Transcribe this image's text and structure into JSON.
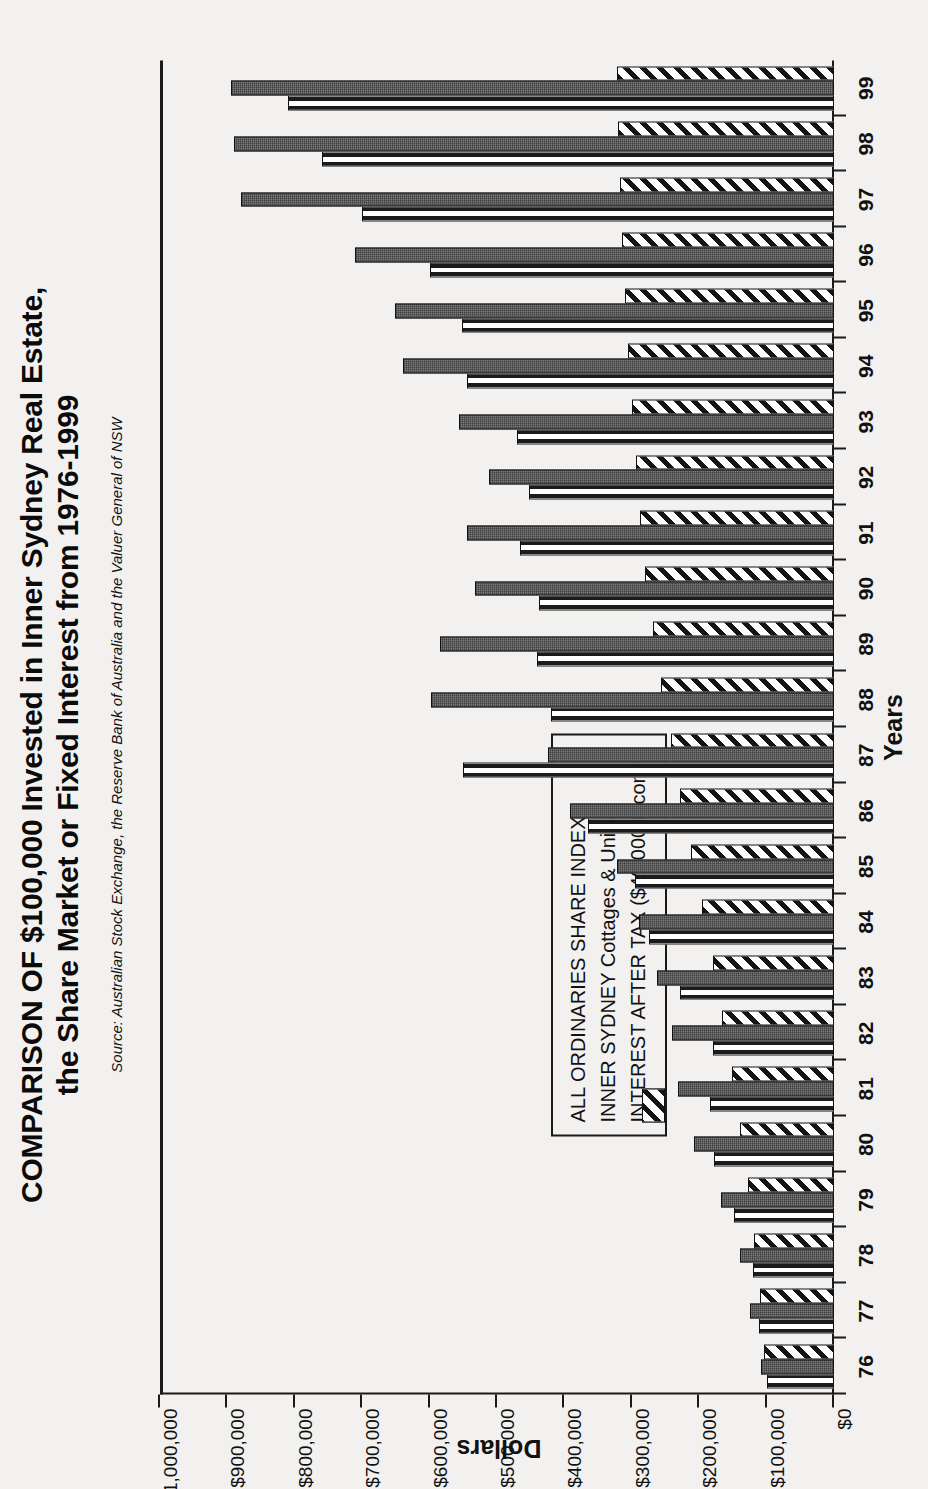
{
  "title": {
    "line1": "COMPARISON OF $100,000 Invested in Inner Sydney Real Estate,",
    "line2": "the Share Market or Fixed Interest from 1976-1999"
  },
  "source": "Source: Australian Stock Exchange, the Reserve Bank of Australia and the Valuer General of NSW",
  "legend": {
    "items": [
      {
        "label": "ALL ORDINARIES SHARE INDEX",
        "swatch": "vertical-stripe-swatch",
        "color": "#ffffff"
      },
      {
        "label": "INNER SYDNEY Cottages & Units",
        "swatch": "solid-grey-swatch",
        "color": "#5e5e5e"
      },
      {
        "label": "INTEREST AFTER TAX ($40,000 Income)",
        "swatch": "diagonal-hatch-swatch",
        "color": "#ffffff"
      }
    ]
  },
  "chart_data": {
    "type": "bar",
    "title": "COMPARISON OF $100,000 Invested in Inner Sydney Real Estate, the Share Market or Fixed Interest from 1976-1999",
    "subtitle": "Source: Australian Stock Exchange, the Reserve Bank of Australia and the Valuer General of NSW",
    "orientation": "horizontal",
    "xlabel": "Years",
    "ylabel": "Dollars",
    "ylim": [
      0,
      1000000
    ],
    "grid": false,
    "legend_position": "inside-left",
    "categories": [
      "76",
      "77",
      "78",
      "79",
      "80",
      "81",
      "82",
      "83",
      "84",
      "85",
      "86",
      "87",
      "88",
      "89",
      "90",
      "91",
      "92",
      "93",
      "94",
      "95",
      "96",
      "97",
      "98",
      "99"
    ],
    "tick_labels": [
      "$0",
      "$100,000",
      "$200,000",
      "$300,000",
      "$400,000",
      "$500,000",
      "$600,000",
      "$700,000",
      "$800,000",
      "$900,000",
      "$1,000,000"
    ],
    "tick_values": [
      0,
      100000,
      200000,
      300000,
      400000,
      500000,
      600000,
      700000,
      800000,
      900000,
      1000000
    ],
    "series": [
      {
        "name": "ALL ORDINARIES SHARE INDEX",
        "color": "#ffffff",
        "pattern": "vertical-stripes",
        "values": [
          100000,
          112000,
          120000,
          148000,
          178000,
          184000,
          180000,
          228000,
          274000,
          295000,
          365000,
          550000,
          420000,
          440000,
          438000,
          466000,
          452000,
          470000,
          545000,
          552000,
          600000,
          700000,
          760000,
          810000
        ]
      },
      {
        "name": "INNER SYDNEY Cottages & Units",
        "color": "#5e5e5e",
        "pattern": "solid-grey",
        "values": [
          108000,
          125000,
          140000,
          168000,
          208000,
          232000,
          240000,
          262000,
          290000,
          322000,
          392000,
          425000,
          598000,
          585000,
          532000,
          545000,
          512000,
          556000,
          640000,
          652000,
          710000,
          880000,
          890000,
          895000
        ]
      },
      {
        "name": "INTEREST AFTER TAX ($40,000 Income)",
        "color": "#ffffff",
        "pattern": "diagonal-hatch",
        "values": [
          104000,
          110000,
          118000,
          128000,
          140000,
          152000,
          166000,
          180000,
          196000,
          212000,
          228000,
          242000,
          256000,
          268000,
          280000,
          288000,
          294000,
          300000,
          305000,
          310000,
          315000,
          318000,
          320000,
          322000
        ]
      }
    ]
  }
}
